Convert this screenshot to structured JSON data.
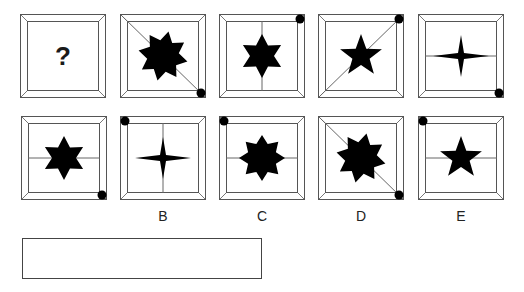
{
  "puzzle": {
    "question_cells": [
      {
        "id": "q1",
        "x": 20,
        "y": 14,
        "content": "question",
        "text": "?",
        "line": "none",
        "dot": "none"
      },
      {
        "id": "q2",
        "x": 120,
        "y": 14,
        "content": "star8-rotated",
        "line": "diag-tl-br",
        "dot": "br"
      },
      {
        "id": "q3",
        "x": 219,
        "y": 14,
        "content": "star6",
        "line": "vertical",
        "dot": "tr"
      },
      {
        "id": "q4",
        "x": 318,
        "y": 14,
        "content": "star5",
        "line": "diag-bl-tr",
        "dot": "tr"
      },
      {
        "id": "q5",
        "x": 418,
        "y": 14,
        "content": "star4",
        "line": "horizontal",
        "dot": "br"
      }
    ],
    "option_cells": [
      {
        "id": "A",
        "label": "",
        "x": 21,
        "y": 116,
        "content": "star6",
        "line": "horizontal",
        "dot": "br"
      },
      {
        "id": "B",
        "label": "B",
        "x": 120,
        "y": 116,
        "content": "star4",
        "line": "vertical",
        "dot": "tl"
      },
      {
        "id": "C",
        "label": "C",
        "x": 219,
        "y": 116,
        "content": "star8",
        "line": "horizontal",
        "dot": "tl"
      },
      {
        "id": "D",
        "label": "D",
        "x": 318,
        "y": 116,
        "content": "star8-rotated",
        "line": "diag-tl-br",
        "dot": "br"
      },
      {
        "id": "E",
        "label": "E",
        "x": 418,
        "y": 116,
        "content": "star5",
        "line": "horizontal",
        "dot": "tl"
      }
    ],
    "answer_box": {
      "value": ""
    },
    "colors": {
      "shape": "#000000",
      "frame": "#555555",
      "line": "#666666"
    }
  }
}
